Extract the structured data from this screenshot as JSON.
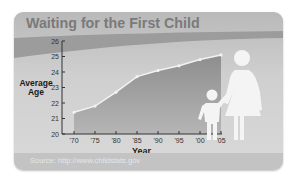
{
  "chart_data": {
    "type": "area",
    "title": "Waiting for the First Child",
    "xlabel": "Year",
    "ylabel": "Average Age",
    "x": [
      "'70",
      "'75",
      "'80",
      "'85",
      "'90",
      "'95",
      "'00",
      "'05"
    ],
    "series": [
      {
        "name": "Average age of mother at first birth",
        "values": [
          21.4,
          21.8,
          22.7,
          23.7,
          24.1,
          24.4,
          24.8,
          25.1
        ]
      }
    ],
    "ylim": [
      20,
      26
    ],
    "yticks": [
      20,
      21,
      22,
      23,
      24,
      25,
      26
    ],
    "grid": false,
    "legend": "none",
    "source": "Source: http://www.childstats.gov",
    "illustration": "mother-and-child-silhouette"
  },
  "colors": {
    "area_top": "#8e8e8e",
    "area_bottom": "#b5b5b5",
    "line": "#f2f2f2",
    "band": "#9c9c9c",
    "axis": "#333333",
    "figure": "#f4f4f4"
  }
}
